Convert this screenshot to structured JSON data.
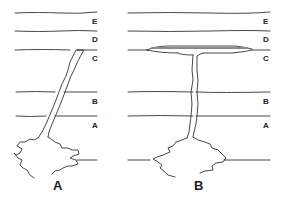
{
  "diagram": {
    "type": "geological-cross-section",
    "panels": [
      {
        "caption": "A",
        "feature": "inclined dike",
        "layers": [
          "E",
          "D",
          "C",
          "B",
          "A"
        ]
      },
      {
        "caption": "B",
        "feature": "vertical feeder dike with sill",
        "layers": [
          "E",
          "D",
          "C",
          "B",
          "A"
        ]
      }
    ]
  },
  "colors": {
    "line": "#333333",
    "background": "#ffffff"
  }
}
